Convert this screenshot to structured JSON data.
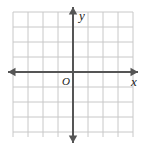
{
  "figure": {
    "name": "coordinate-plane",
    "width": 142,
    "height": 148,
    "background_color": "#ffffff"
  },
  "grid": {
    "color": "#c8c8c8",
    "line_width": 1,
    "cell_size": 15,
    "columns": 8,
    "rows": 8,
    "left": 13,
    "top": 12,
    "right": 133,
    "bottom": 137
  },
  "axes": {
    "color": "#555555",
    "line_width": 2,
    "origin_x": 73,
    "origin_y": 72,
    "x_axis": {
      "label": "x",
      "label_x": 131,
      "label_y": 86,
      "start_x": 8,
      "end_x": 138,
      "arrow_left": true,
      "arrow_right": true
    },
    "y_axis": {
      "label": "y",
      "label_x": 79,
      "label_y": 20,
      "start_y": 7,
      "end_y": 143,
      "arrow_up": true,
      "arrow_down": true
    },
    "origin": {
      "label": "O",
      "label_x": 62,
      "label_y": 85
    }
  },
  "chart_data": {
    "type": "scatter",
    "title": "",
    "xlabel": "x",
    "ylabel": "y",
    "xlim": [
      -4,
      4
    ],
    "ylim": [
      -4,
      4
    ],
    "xticks": [
      -4,
      -3,
      -2,
      -1,
      0,
      1,
      2,
      3,
      4
    ],
    "yticks": [
      -4,
      -3,
      -2,
      -1,
      0,
      1,
      2,
      3,
      4
    ],
    "tick_labels_shown": false,
    "grid": true,
    "grid_spacing": 1,
    "legend": false,
    "series": [],
    "annotations": [
      {
        "text": "y",
        "x": 0,
        "y": 4,
        "style": "italic"
      },
      {
        "text": "x",
        "x": 4,
        "y": 0,
        "style": "italic"
      },
      {
        "text": "O",
        "x": 0,
        "y": 0,
        "style": "italic"
      }
    ]
  }
}
